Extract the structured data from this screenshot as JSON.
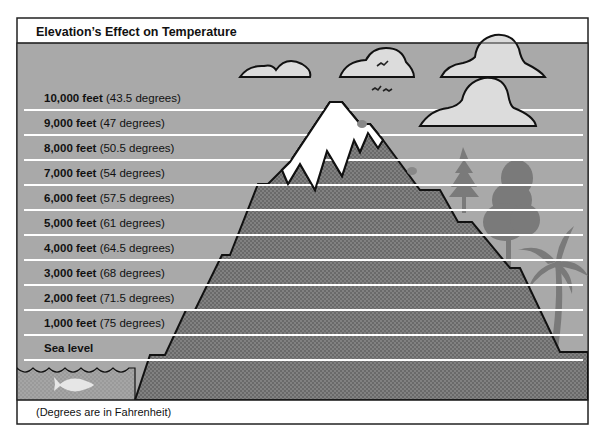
{
  "figure": {
    "title": "Elevation’s Effect on Temperature",
    "footnote": "(Degrees are in Fahrenheit)",
    "colors": {
      "sky": "#a9a9a9",
      "cloud": "#dcdcdc",
      "mountain": "#6e6e6e",
      "snow": "#ffffff",
      "trees": "#7a7a7a",
      "lines": "#ffffff",
      "outline": "#111111"
    },
    "levels": [
      {
        "elevation": "10,000 feet",
        "temperature": "(43.5 degrees)"
      },
      {
        "elevation": "9,000 feet",
        "temperature": "(47 degrees)"
      },
      {
        "elevation": "8,000 feet",
        "temperature": "(50.5 degrees)"
      },
      {
        "elevation": "7,000 feet",
        "temperature": "(54 degrees)"
      },
      {
        "elevation": "6,000 feet",
        "temperature": "(57.5 degrees)"
      },
      {
        "elevation": "5,000 feet",
        "temperature": "(61 degrees)"
      },
      {
        "elevation": "4,000 feet",
        "temperature": "(64.5 degrees)"
      },
      {
        "elevation": "3,000 feet",
        "temperature": "(68 degrees)"
      },
      {
        "elevation": "2,000 feet",
        "temperature": "(71.5 degrees)"
      },
      {
        "elevation": "1,000 feet",
        "temperature": "(75 degrees)"
      },
      {
        "elevation": "Sea level",
        "temperature": ""
      }
    ],
    "illustration_elements": [
      "cloud-icon",
      "bird-icon",
      "mountain",
      "snow-cap",
      "pine-tree-icon",
      "deciduous-tree-icon",
      "palm-tree-icon",
      "fish-icon",
      "water-waves"
    ]
  }
}
